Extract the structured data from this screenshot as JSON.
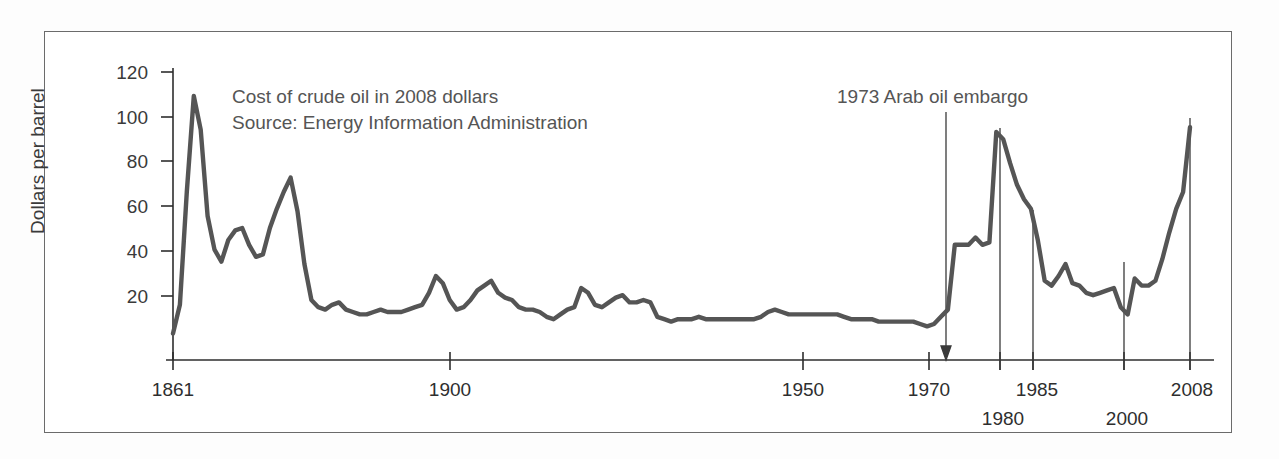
{
  "chart_data": {
    "type": "line",
    "title": "",
    "xlabel": "",
    "ylabel": "Dollars per barrel",
    "ylim": [
      0,
      120
    ],
    "yticks": [
      20,
      40,
      60,
      80,
      100,
      120
    ],
    "xlim": [
      1861,
      2008
    ],
    "xticks": [
      1861,
      1900,
      1950,
      1970,
      1980,
      1985,
      2000,
      2008
    ],
    "xticks_upper": [
      1861,
      1900,
      1950,
      1970,
      1985,
      2008
    ],
    "xticks_lower": [
      1980,
      2000
    ],
    "grid": false,
    "legend": null,
    "series_name": "Crude oil price (2008 dollars)",
    "line_color": "#555555",
    "x": [
      1861,
      1862,
      1863,
      1864,
      1865,
      1866,
      1867,
      1868,
      1869,
      1870,
      1871,
      1872,
      1873,
      1874,
      1875,
      1876,
      1877,
      1878,
      1879,
      1880,
      1881,
      1882,
      1883,
      1884,
      1885,
      1886,
      1887,
      1888,
      1889,
      1890,
      1891,
      1892,
      1893,
      1894,
      1895,
      1896,
      1897,
      1898,
      1899,
      1900,
      1901,
      1902,
      1903,
      1904,
      1905,
      1906,
      1907,
      1908,
      1909,
      1910,
      1911,
      1912,
      1913,
      1914,
      1915,
      1916,
      1917,
      1918,
      1919,
      1920,
      1921,
      1922,
      1923,
      1924,
      1925,
      1926,
      1927,
      1928,
      1929,
      1930,
      1931,
      1932,
      1933,
      1934,
      1935,
      1936,
      1937,
      1938,
      1939,
      1940,
      1941,
      1942,
      1943,
      1944,
      1945,
      1946,
      1947,
      1948,
      1949,
      1950,
      1951,
      1952,
      1953,
      1954,
      1955,
      1956,
      1957,
      1958,
      1959,
      1960,
      1961,
      1962,
      1963,
      1964,
      1965,
      1966,
      1967,
      1968,
      1969,
      1970,
      1971,
      1972,
      1973,
      1974,
      1975,
      1976,
      1977,
      1978,
      1979,
      1980,
      1981,
      1982,
      1983,
      1984,
      1985,
      1986,
      1987,
      1988,
      1989,
      1990,
      1991,
      1992,
      1993,
      1994,
      1995,
      1996,
      1997,
      1998,
      1999,
      2000,
      2001,
      2002,
      2003,
      2004,
      2005,
      2006,
      2007,
      2008
    ],
    "y": [
      11,
      23,
      70,
      110,
      96,
      60,
      46,
      41,
      50,
      54,
      55,
      48,
      43,
      44,
      55,
      63,
      70,
      76,
      62,
      40,
      25,
      22,
      21,
      23,
      24,
      21,
      20,
      19,
      19,
      20,
      21,
      20,
      20,
      20,
      21,
      22,
      23,
      28,
      35,
      32,
      25,
      21,
      22,
      25,
      29,
      31,
      33,
      28,
      26,
      25,
      22,
      21,
      21,
      20,
      18,
      17,
      19,
      21,
      22,
      30,
      28,
      23,
      22,
      24,
      26,
      27,
      24,
      24,
      25,
      24,
      18,
      17,
      16,
      17,
      17,
      17,
      18,
      17,
      17,
      17,
      17,
      17,
      17,
      17,
      17,
      18,
      20,
      21,
      20,
      19,
      19,
      19,
      19,
      19,
      19,
      19,
      19,
      18,
      17,
      17,
      17,
      17,
      16,
      16,
      16,
      16,
      16,
      16,
      15,
      14,
      15,
      18,
      21,
      48,
      48,
      48,
      51,
      48,
      49,
      95,
      92,
      82,
      73,
      67,
      63,
      50,
      33,
      31,
      35,
      40,
      32,
      31,
      28,
      27,
      28,
      29,
      30,
      22,
      19,
      34,
      31,
      31,
      33,
      42,
      53,
      63,
      70,
      97
    ],
    "annotations": [
      {
        "text": "Cost of crude oil in 2008 dollars",
        "x": 1880,
        "y": 108
      },
      {
        "text": "Source: Energy Information Administration",
        "x": 1880,
        "y": 101
      },
      {
        "text": "1973 Arab oil embargo",
        "x": 1980,
        "y": 108,
        "points_to": 1973
      }
    ],
    "vertical_reference_lines": [
      1973,
      1980,
      1985,
      2000,
      2008
    ]
  },
  "axis": {
    "y_label": "Dollars per barrel",
    "y_ticks": [
      "120",
      "100",
      "80",
      "60",
      "40",
      "20"
    ],
    "x_ticks_upper": [
      "1861",
      "1900",
      "1950",
      "1970",
      "1985",
      "2008"
    ],
    "x_ticks_lower": [
      "1980",
      "2000"
    ]
  },
  "annotations": {
    "note_line1": "Cost of crude oil in 2008 dollars",
    "note_line2": "Source: Energy Information Administration",
    "embargo_label": "1973 Arab oil embargo"
  },
  "colors": {
    "line": "#555555",
    "axis": "#2e2e2e",
    "frame": "#6b6b6b",
    "text": "#3a3a3a"
  }
}
